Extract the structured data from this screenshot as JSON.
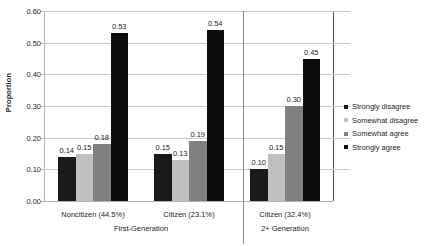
{
  "chart_data": {
    "type": "bar",
    "title": "",
    "xlabel": "",
    "ylabel": "Proportion",
    "ylim": [
      0.0,
      0.6
    ],
    "ytick_labels": [
      "0.00",
      "0.10",
      "0.20",
      "0.30",
      "0.40",
      "0.50",
      "0.60"
    ],
    "ytick_values": [
      0.0,
      0.1,
      0.2,
      0.3,
      0.4,
      0.5,
      0.6
    ],
    "grid": true,
    "legend_position": "right",
    "categories": [
      "Noncitizen (44.5%)",
      "Citizen (23.1%)",
      "Citizen (32.4%)"
    ],
    "group_headers": [
      {
        "label": "First-Generation",
        "categories": [
          "Noncitizen (44.5%)",
          "Citizen (23.1%)"
        ]
      },
      {
        "label": "2+ Generation",
        "categories": [
          "Citizen (32.4%)"
        ]
      }
    ],
    "series": [
      {
        "name": "Strongly disagree",
        "color": "#1a1a1a",
        "values": [
          0.14,
          0.15,
          0.1
        ]
      },
      {
        "name": "Somewhat disagree",
        "color": "#bfbfbf",
        "values": [
          0.15,
          0.13,
          0.15
        ]
      },
      {
        "name": "Somewhat agree",
        "color": "#808080",
        "values": [
          0.18,
          0.19,
          0.3
        ]
      },
      {
        "name": "Strongly agree",
        "color": "#0d0d0d",
        "values": [
          0.53,
          0.54,
          0.45
        ]
      }
    ],
    "data_labels": [
      [
        "0.14",
        "0.15",
        "0.18",
        "0.53"
      ],
      [
        "0.15",
        "0.13",
        "0.19",
        "0.54"
      ],
      [
        "0.10",
        "0.15",
        "0.30",
        "0.45"
      ]
    ]
  },
  "legend": {
    "items": [
      {
        "label": "Strongly disagree",
        "color": "#1a1a1a"
      },
      {
        "label": "Somewhat disagree",
        "color": "#bfbfbf"
      },
      {
        "label": "Somewhat agree",
        "color": "#808080"
      },
      {
        "label": "Strongly agree",
        "color": "#0d0d0d"
      }
    ]
  }
}
